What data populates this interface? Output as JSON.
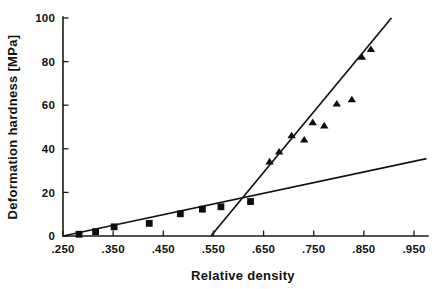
{
  "chart_data": {
    "type": "scatter",
    "title": "",
    "xlabel": "Relative density",
    "ylabel": "Deformation hardness [MPa]",
    "xlim": [
      0.25,
      0.97
    ],
    "ylim": [
      0,
      100
    ],
    "grid": false,
    "legend": "none",
    "xticks": [
      ".250",
      ".350",
      ".450",
      ".550",
      ".650",
      ".750",
      ".850",
      ".950"
    ],
    "xtick_values": [
      0.25,
      0.35,
      0.45,
      0.55,
      0.65,
      0.75,
      0.85,
      0.95
    ],
    "yticks": [
      "0",
      "20",
      "40",
      "60",
      "80",
      "100"
    ],
    "ytick_values": [
      0,
      20,
      40,
      60,
      80,
      100
    ],
    "series": [
      {
        "name": "low-density-squares",
        "marker": "square",
        "x": [
          0.282,
          0.315,
          0.352,
          0.422,
          0.484,
          0.528,
          0.565,
          0.624
        ],
        "y": [
          0.8,
          2.0,
          4.2,
          5.8,
          10.2,
          12.3,
          13.4,
          15.8
        ]
      },
      {
        "name": "high-density-triangles",
        "marker": "triangle",
        "x": [
          0.662,
          0.681,
          0.706,
          0.731,
          0.748,
          0.771,
          0.796,
          0.826,
          0.846,
          0.864
        ],
        "y": [
          34.0,
          38.5,
          46.0,
          44.0,
          52.0,
          50.5,
          60.5,
          62.5,
          82.0,
          85.5
        ]
      }
    ],
    "fits": [
      {
        "name": "shallow-fit-line",
        "x": [
          0.25,
          0.975
        ],
        "y": [
          0.0,
          35.5
        ]
      },
      {
        "name": "steep-fit-line",
        "x": [
          0.545,
          0.905
        ],
        "y": [
          0.0,
          100.0
        ]
      }
    ]
  }
}
